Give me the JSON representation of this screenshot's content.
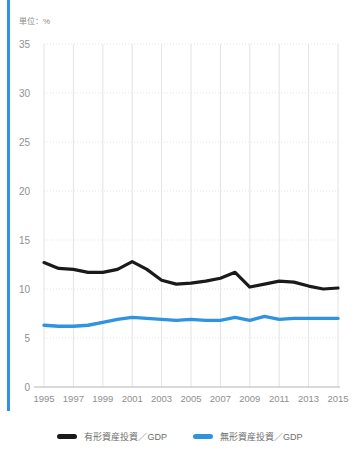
{
  "unit_label": "単位：%",
  "top_title": "",
  "accent_color": "#2f93e0",
  "legend": {
    "items": [
      {
        "label": "有形資産投資／GDP",
        "color": "#1a1a1a"
      },
      {
        "label": "無形資産投資／GDP",
        "color": "#2f93e0"
      }
    ]
  },
  "chart_data": {
    "type": "line",
    "title": "",
    "xlabel": "",
    "ylabel": "単位：%",
    "ylim": [
      0,
      35
    ],
    "xlim": [
      1995,
      2015
    ],
    "grid": true,
    "legend_position": "bottom",
    "ytick_labels": [
      "0",
      "5",
      "10",
      "15",
      "20",
      "25",
      "30",
      "35"
    ],
    "yticks": [
      0,
      5,
      10,
      15,
      20,
      25,
      30,
      35
    ],
    "xtick_labels": [
      "1995",
      "1997",
      "1999",
      "2001",
      "2003",
      "2005",
      "2007",
      "2009",
      "2011",
      "2013",
      "2015"
    ],
    "xticks": [
      1995,
      1997,
      1999,
      2001,
      2003,
      2005,
      2007,
      2009,
      2011,
      2013,
      2015
    ],
    "x": [
      1995,
      1996,
      1997,
      1998,
      1999,
      2000,
      2001,
      2002,
      2003,
      2004,
      2005,
      2006,
      2007,
      2008,
      2009,
      2010,
      2011,
      2012,
      2013,
      2014,
      2015
    ],
    "series": [
      {
        "name": "有形資産投資／GDP",
        "color": "#1a1a1a",
        "values": [
          12.7,
          12.1,
          12.0,
          11.7,
          11.7,
          12.0,
          12.8,
          12.0,
          10.9,
          10.5,
          10.6,
          10.8,
          11.1,
          11.7,
          10.2,
          10.5,
          10.8,
          10.7,
          10.3,
          10.0,
          10.1
        ]
      },
      {
        "name": "無形資産投資／GDP",
        "color": "#2f93e0",
        "values": [
          6.3,
          6.2,
          6.2,
          6.3,
          6.6,
          6.9,
          7.1,
          7.0,
          6.9,
          6.8,
          6.9,
          6.8,
          6.8,
          7.1,
          6.8,
          7.2,
          6.9,
          7.0,
          7.0,
          7.0,
          7.0
        ]
      }
    ]
  }
}
